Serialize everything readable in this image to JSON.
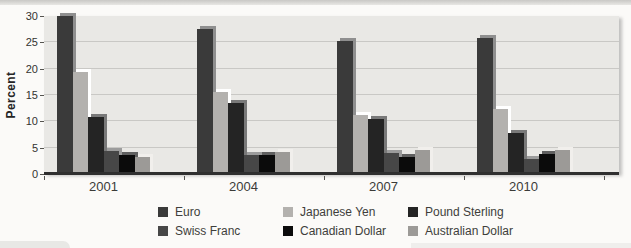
{
  "figure": {
    "page_background": "#fbfaf8",
    "plot_background": "#e9e8e5",
    "gridline_color": "#c9c8c5",
    "axis_color": "#2f2f2f",
    "text_color": "#3b3b38"
  },
  "chart_data": {
    "type": "bar",
    "title": "",
    "xlabel": "",
    "ylabel": "Percent",
    "ylim": [
      0,
      30
    ],
    "yticks": [
      0,
      5,
      10,
      15,
      20,
      25,
      30
    ],
    "grid": true,
    "legend_position": "bottom",
    "categories": [
      "2001",
      "2004",
      "2007",
      "2010"
    ],
    "series": [
      {
        "name": "Euro",
        "color": "#3a3a3a",
        "values": [
          30.0,
          27.5,
          25.2,
          25.8
        ]
      },
      {
        "name": "Japanese Yen",
        "color": "#b3b1ae",
        "values": [
          19.3,
          15.5,
          11.2,
          12.4
        ]
      },
      {
        "name": "Pound Sterling",
        "color": "#242424",
        "values": [
          10.8,
          13.5,
          10.4,
          7.7
        ]
      },
      {
        "name": "Swiss Franc",
        "color": "#474747",
        "values": [
          4.3,
          3.7,
          3.9,
          2.9
        ]
      },
      {
        "name": "Canadian Dollar",
        "color": "#0b0b0b",
        "values": [
          3.6,
          3.6,
          3.2,
          3.8
        ]
      },
      {
        "name": "Australian Dollar",
        "color": "#9c9a97",
        "values": [
          3.3,
          4.1,
          4.6,
          4.6
        ]
      }
    ]
  }
}
